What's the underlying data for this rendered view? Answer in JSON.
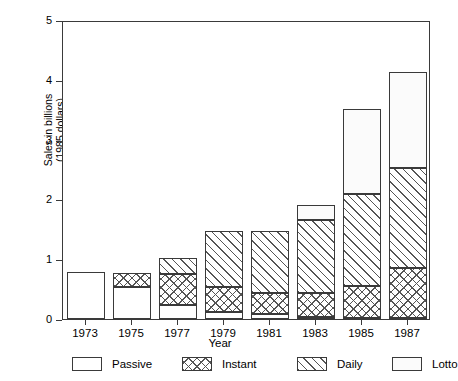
{
  "chart_data": {
    "type": "bar",
    "subtype": "stacked-bar",
    "title": "",
    "xlabel": "Year",
    "ylabel": "Sales in billions (1985 dollars)",
    "ylabel_line1": "Sales in billions",
    "ylabel_line2": "(1985 dollars)",
    "categories": [
      "1973",
      "1975",
      "1977",
      "1979",
      "1981",
      "1983",
      "1985",
      "1987"
    ],
    "series": [
      {
        "name": "Passive",
        "values": [
          0.79,
          0.53,
          0.23,
          0.12,
          0.08,
          0.03,
          0.02,
          0.01
        ]
      },
      {
        "name": "Instant",
        "values": [
          0.0,
          0.24,
          0.52,
          0.41,
          0.36,
          0.41,
          0.53,
          0.85
        ]
      },
      {
        "name": "Daily",
        "values": [
          0.0,
          0.0,
          0.27,
          0.94,
          1.04,
          1.22,
          1.54,
          1.67
        ]
      },
      {
        "name": "Lotto",
        "values": [
          0.0,
          0.0,
          0.0,
          0.0,
          0.0,
          0.25,
          1.42,
          1.6
        ]
      }
    ],
    "totals": [
      0.79,
      0.77,
      1.02,
      1.47,
      1.48,
      1.91,
      3.51,
      4.13
    ],
    "ylim": [
      0,
      5
    ],
    "yticks": [
      0,
      1,
      2,
      3,
      4,
      5
    ],
    "ytick_labels": [
      "0",
      "1",
      "2",
      "3",
      "4",
      "5"
    ],
    "grid": false,
    "legend_position": "below",
    "legend": [
      {
        "label": "Passive",
        "pattern": "solid-white"
      },
      {
        "label": "Instant",
        "pattern": "crosshatch"
      },
      {
        "label": "Daily",
        "pattern": "diagonal-hatch"
      },
      {
        "label": "Lotto",
        "pattern": "dotted"
      }
    ],
    "colors": {
      "axis": "#3a3a3a",
      "outline": "#3a3a3a",
      "hatch": "#555555",
      "background": "#ffffff"
    }
  }
}
